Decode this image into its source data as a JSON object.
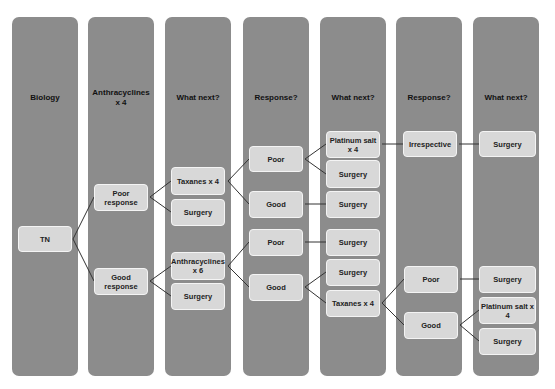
{
  "columns": [
    {
      "header": "Biology"
    },
    {
      "header": "Anthracyclines x 4"
    },
    {
      "header": "What next?"
    },
    {
      "header": "Response?"
    },
    {
      "header": "What next?"
    },
    {
      "header": "Response?"
    },
    {
      "header": "What next?"
    }
  ],
  "nodes": {
    "tn": "TN",
    "poor_response": "Poor response",
    "good_response": "Good response",
    "taxanes_x4_a": "Taxanes x 4",
    "surgery_a": "Surgery",
    "anthracyclines_x6": "Anthracyclines x 6",
    "surgery_b": "Surgery",
    "poor_a": "Poor",
    "good_a": "Good",
    "poor_b": "Poor",
    "good_b": "Good",
    "platinum_a": "Platinum salt x 4",
    "surgery_c": "Surgery",
    "surgery_d": "Surgery",
    "surgery_e": "Surgery",
    "surgery_f": "Surgery",
    "taxanes_x4_b": "Taxanes x 4",
    "irrespective": "Irrespective",
    "poor_c": "Poor",
    "good_c": "Good",
    "surgery_g": "Surgery",
    "surgery_h": "Surgery",
    "platinum_b": "Platinum salt x 4",
    "surgery_i": "Surgery"
  },
  "colors": {
    "column": "#8c8c8c",
    "box": "#d8d8d8",
    "line": "#333333"
  }
}
